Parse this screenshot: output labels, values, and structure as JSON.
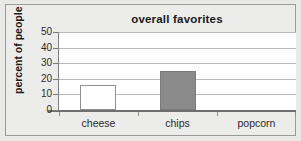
{
  "chart_data": {
    "type": "bar",
    "title": "overall favorites",
    "xlabel": "",
    "ylabel": "percent of people",
    "categories": [
      "cheese",
      "chips",
      "popcorn"
    ],
    "values": [
      16,
      25,
      0
    ],
    "ylim": [
      0,
      50
    ],
    "yticks": [
      0,
      10,
      20,
      30,
      40,
      50
    ],
    "ytick_labels": [
      "0",
      "10",
      "20",
      "30",
      "40",
      "50"
    ],
    "grid": true,
    "legend": "none",
    "series": [
      {
        "name": "percent of people",
        "values": [
          16,
          25,
          0
        ]
      }
    ],
    "bar_styles": [
      "hollow",
      "filled",
      "none"
    ],
    "colors": {
      "bar_fill": "#8a8a8a",
      "bar_outline": "#8f8f8f",
      "plot_background": "#ffffff",
      "gridline": "#b9b9b9",
      "axis": "#7d7d7d",
      "page_background": "#ececeb",
      "text": "#1a1a1a"
    }
  }
}
